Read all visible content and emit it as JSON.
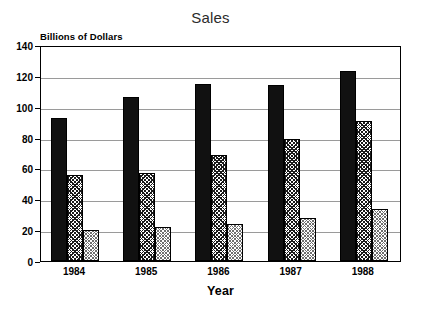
{
  "chart_data": {
    "type": "bar",
    "title": "Sales",
    "xlabel": "Year",
    "ylabel": "Billions of Dollars",
    "categories": [
      "1984",
      "1985",
      "1986",
      "1987",
      "1988"
    ],
    "series": [
      {
        "name": "series-1-solid-black",
        "pattern": "solid-black",
        "values": [
          93,
          106,
          115,
          114,
          123
        ]
      },
      {
        "name": "series-2-cross-hatch",
        "pattern": "dark-cross-hatch",
        "values": [
          56,
          57,
          69,
          79,
          91
        ]
      },
      {
        "name": "series-3-light-stipple",
        "pattern": "light-stipple",
        "values": [
          20,
          22,
          24,
          28,
          34
        ]
      }
    ],
    "ylim": [
      0,
      140
    ],
    "ytick_labels": [
      "0",
      "20",
      "40",
      "60",
      "80",
      "100",
      "120",
      "140"
    ],
    "ytick_values": [
      0,
      20,
      40,
      60,
      80,
      100,
      120,
      140
    ],
    "grid": true,
    "legend": "none",
    "colors": {
      "series_1": "#111111",
      "series_2": "#1a1a1a",
      "series_3": "#6f6f6f",
      "axis": "#000000",
      "gridline": "#9a9a9a",
      "background": "#ffffff",
      "title_text": "#2b2b2b"
    }
  }
}
